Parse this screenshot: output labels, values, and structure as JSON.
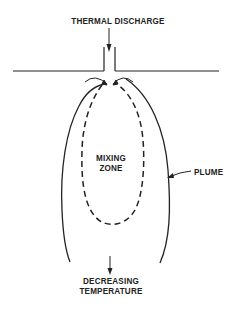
{
  "diagram": {
    "labels": {
      "discharge": "THERMAL DISCHARGE",
      "mixing_line1": "MIXING",
      "mixing_line2": "ZONE",
      "plume": "PLUME",
      "decreasing_line1": "DECREASING",
      "decreasing_line2": "TEMPERATURE"
    },
    "elements": [
      {
        "id": "shoreline",
        "type": "solid-line",
        "description": "horizontal shoreline/wall"
      },
      {
        "id": "discharge-pipe",
        "type": "channel",
        "description": "vertical outlet channel"
      },
      {
        "id": "plume-boundary",
        "type": "solid-curve",
        "description": "outer plume boundary"
      },
      {
        "id": "mixing-zone-boundary",
        "type": "dashed-curve",
        "description": "inner mixing zone boundary"
      },
      {
        "id": "flow-arrows",
        "type": "arrows",
        "description": "curved flow arrows at outlet"
      },
      {
        "id": "temperature-arrow",
        "type": "arrow",
        "description": "downward arrow indicating decreasing temperature"
      }
    ],
    "colors": {
      "ink": "#222222",
      "background": "#ffffff"
    }
  }
}
